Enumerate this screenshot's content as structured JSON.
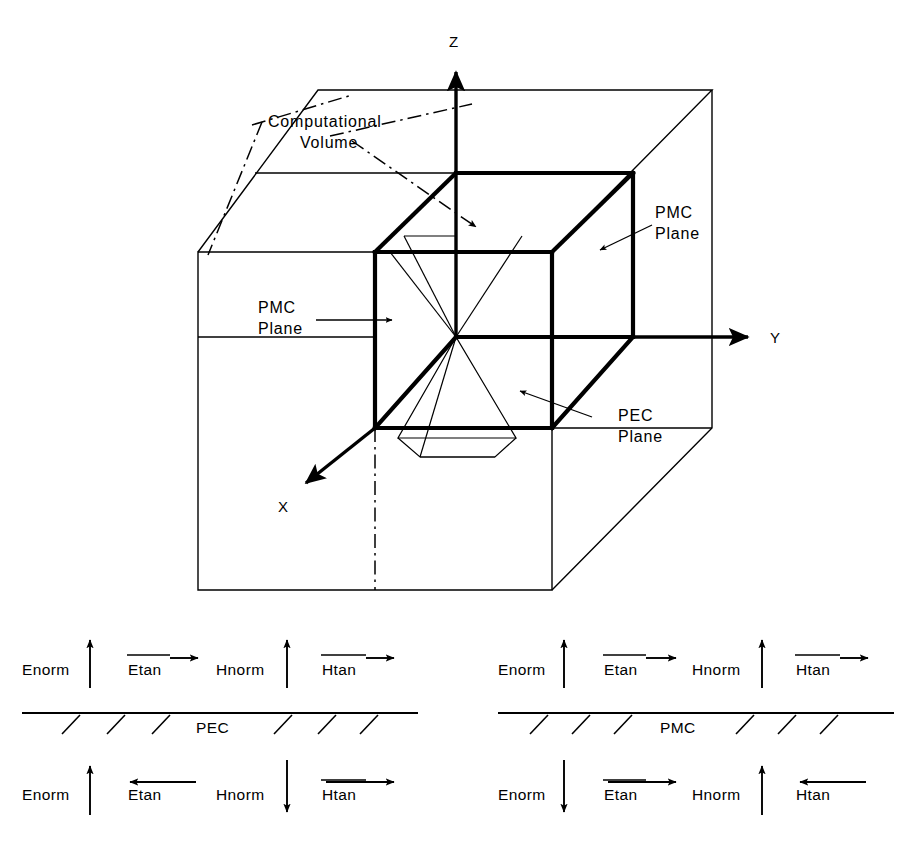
{
  "figure": {
    "colors": {
      "ink": "#000000",
      "paper": "#ffffff"
    }
  },
  "axes": {
    "z_label": "Z",
    "y_label": "Y",
    "x_label": "X"
  },
  "callouts": {
    "computational_volume": {
      "line1": "Computational",
      "line2": "Volume"
    },
    "pmc_plane_right": {
      "line1": "PMC",
      "line2": "Plane"
    },
    "pmc_plane_left": {
      "line1": "PMC",
      "line2": "Plane"
    },
    "pec_plane": {
      "line1": "PEC",
      "line2": "Plane"
    }
  },
  "boundary_panels": [
    {
      "id": "pec",
      "surface_label": "PEC",
      "above": [
        {
          "field": "Enorm",
          "direction": "up",
          "overline": false
        },
        {
          "field": "Etan",
          "direction": "right",
          "overline": true
        },
        {
          "field": "Hnorm",
          "direction": "up",
          "overline": false
        },
        {
          "field": "Htan",
          "direction": "right",
          "overline": true
        }
      ],
      "below": [
        {
          "field": "Enorm",
          "direction": "up",
          "overline": false
        },
        {
          "field": "Etan",
          "direction": "left",
          "overline": true
        },
        {
          "field": "Hnorm",
          "direction": "down",
          "overline": false
        },
        {
          "field": "Htan",
          "direction": "right",
          "overline": true
        }
      ]
    },
    {
      "id": "pmc",
      "surface_label": "PMC",
      "above": [
        {
          "field": "Enorm",
          "direction": "up",
          "overline": false
        },
        {
          "field": "Etan",
          "direction": "right",
          "overline": true
        },
        {
          "field": "Hnorm",
          "direction": "up",
          "overline": false
        },
        {
          "field": "Htan",
          "direction": "right",
          "overline": true
        }
      ],
      "below": [
        {
          "field": "Enorm",
          "direction": "down",
          "overline": false
        },
        {
          "field": "Etan",
          "direction": "right",
          "overline": true
        },
        {
          "field": "Hnorm",
          "direction": "up",
          "overline": false
        },
        {
          "field": "Htan",
          "direction": "left",
          "overline": true
        }
      ]
    }
  ]
}
